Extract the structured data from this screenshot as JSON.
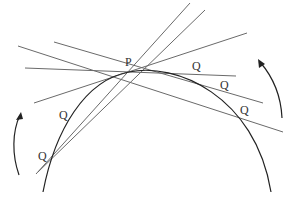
{
  "diagram": {
    "point_label": "P",
    "secant_point_label": "Q",
    "colors": {
      "curve": "#222222",
      "lines": "#666666",
      "arrows": "#222222",
      "text": "#333333"
    },
    "labels": {
      "p": "P",
      "q_left_1": "Q",
      "q_left_2": "Q",
      "q_right_1": "Q",
      "q_right_2": "Q",
      "q_right_3": "Q"
    }
  }
}
